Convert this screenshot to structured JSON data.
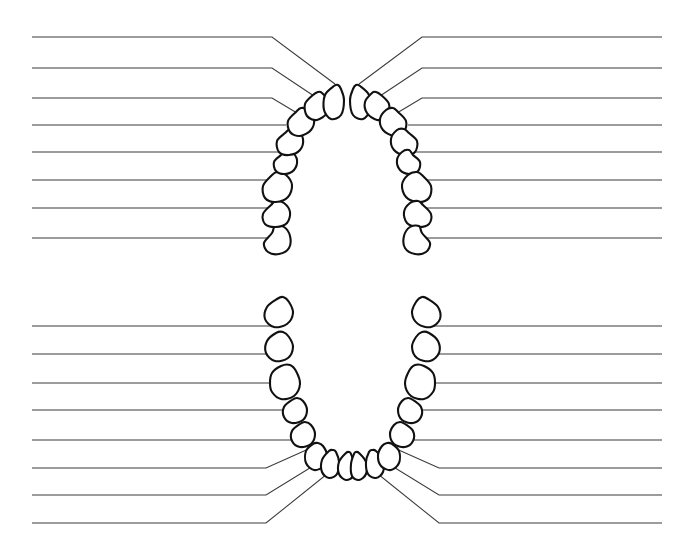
{
  "page": {
    "width": 694,
    "height": 558,
    "background_color": "#ffffff"
  },
  "style": {
    "tooth_outline_color": "#111111",
    "tooth_fill_color": "#ffffff",
    "leader_line_color": "#3a3a3a",
    "tooth_stroke_width": 2.1,
    "leader_stroke_width": 1.05
  },
  "diagram": {
    "type": "dental-arch-worksheet",
    "arches": [
      {
        "name": "upper-arch",
        "label": "Maxillary (upper) arch",
        "orientation": "opening-downward",
        "tooth_count": 16,
        "blank_label_line_count": 16
      },
      {
        "name": "lower-arch",
        "label": "Mandibular (lower) arch",
        "orientation": "opening-upward",
        "tooth_count": 16,
        "blank_label_line_count": 16
      }
    ],
    "total_teeth": 32,
    "total_label_lines": 32,
    "label_text": ""
  },
  "upper_arch": {
    "teeth": [
      {
        "id": "U-L-8",
        "side": "left",
        "points": "272,233 264,243 268,252 279,254 289,248 290,236 284,227 275,226"
      },
      {
        "id": "U-L-7",
        "side": "left",
        "points": "271,205 263,214 265,224 276,227 287,223 290,212 284,203 276,201"
      },
      {
        "id": "U-L-6",
        "side": "left",
        "points": "271,176 263,186 265,198 276,202 288,197 292,185 286,175 277,172"
      },
      {
        "id": "U-L-5",
        "side": "left",
        "points": "281,155 274,162 276,171 285,174 294,170 297,160 292,152 285,150"
      },
      {
        "id": "U-L-4",
        "side": "left",
        "points": "285,133 277,141 279,152 289,155 300,150 303,139 297,130 290,129"
      },
      {
        "id": "U-L-3",
        "side": "left",
        "points": "296,112 288,121 290,132 300,136 311,130 314,119 308,110 301,108"
      },
      {
        "id": "U-L-2",
        "side": "left",
        "points": "313,95 305,104 307,116 317,120 327,113 329,102 322,93 318,92"
      },
      {
        "id": "U-L-1",
        "side": "left",
        "points": "334,86 325,95 324,110 331,119 341,115 344,100 341,89 338,85"
      },
      {
        "id": "U-R-1",
        "side": "right",
        "points": "360,86 369,95 370,110 363,119 353,115 350,100 353,89 356,85"
      },
      {
        "id": "U-R-2",
        "side": "right",
        "points": "381,95 389,104 387,116 377,120 367,113 365,102 372,93 376,92"
      },
      {
        "id": "U-R-3",
        "side": "right",
        "points": "398,112 406,121 404,132 394,136 383,130 380,119 386,110 393,108"
      },
      {
        "id": "U-R-4",
        "side": "right",
        "points": "409,133 417,141 415,152 405,155 394,150 391,139 397,130 404,129"
      },
      {
        "id": "U-R-5",
        "side": "right",
        "points": "413,155 420,162 418,171 409,174 400,170 397,160 402,152 409,150"
      },
      {
        "id": "U-R-6",
        "side": "right",
        "points": "423,176 431,186 429,198 418,202 406,197 402,185 408,175 417,172"
      },
      {
        "id": "U-R-7",
        "side": "right",
        "points": "423,205 431,214 429,224 418,227 407,223 404,212 410,203 418,201"
      },
      {
        "id": "U-R-8",
        "side": "right",
        "points": "422,233 430,243 426,252 415,254 405,248 404,236 410,227 419,226"
      }
    ],
    "leader_lines_left": [
      {
        "id": "UL-line-1",
        "shape": "bent",
        "d": "M 32,37 L 272,37 L 335,84"
      },
      {
        "id": "UL-line-2",
        "shape": "bent",
        "d": "M 32,68 L 272,68 L 314,96"
      },
      {
        "id": "UL-line-3",
        "shape": "bent",
        "d": "M 32,98 L 272,98 L 297,113"
      },
      {
        "id": "UL-line-4",
        "shape": "straight",
        "d": "M 32,125 L 286,125"
      },
      {
        "id": "UL-line-5",
        "shape": "straight",
        "d": "M 32,152 L 281,152"
      },
      {
        "id": "UL-line-6",
        "shape": "straight",
        "d": "M 32,180 L 272,180"
      },
      {
        "id": "UL-line-7",
        "shape": "straight",
        "d": "M 32,208 L 271,208"
      },
      {
        "id": "UL-line-8",
        "shape": "straight",
        "d": "M 32,238 L 271,238"
      }
    ],
    "leader_lines_right": [
      {
        "id": "UR-line-1",
        "shape": "bent",
        "d": "M 662,37 L 422,37 L 359,84"
      },
      {
        "id": "UR-line-2",
        "shape": "bent",
        "d": "M 662,68 L 422,68 L 380,96"
      },
      {
        "id": "UR-line-3",
        "shape": "bent",
        "d": "M 662,98 L 422,98 L 397,113"
      },
      {
        "id": "UR-line-4",
        "shape": "straight",
        "d": "M 662,125 L 408,125"
      },
      {
        "id": "UR-line-5",
        "shape": "straight",
        "d": "M 662,152 L 413,152"
      },
      {
        "id": "UR-line-6",
        "shape": "straight",
        "d": "M 662,180 L 422,180"
      },
      {
        "id": "UR-line-7",
        "shape": "straight",
        "d": "M 662,208 L 423,208"
      },
      {
        "id": "UR-line-8",
        "shape": "straight",
        "d": "M 662,238 L 423,238"
      }
    ]
  },
  "lower_arch": {
    "teeth": [
      {
        "id": "L-L-8",
        "side": "left",
        "points": "277,299 267,307 265,319 274,327 287,324 293,313 289,302 283,297"
      },
      {
        "id": "L-L-7",
        "side": "left",
        "points": "276,333 267,341 266,353 275,361 288,358 293,347 289,337 283,332"
      },
      {
        "id": "L-L-6",
        "side": "left",
        "points": "281,366 272,373 270,383 272,392 281,399 294,396 300,384 296,371 290,365"
      },
      {
        "id": "L-L-5",
        "side": "left",
        "points": "292,400 284,407 284,417 292,423 303,420 307,410 303,401 297,398"
      },
      {
        "id": "L-L-4",
        "side": "left",
        "points": "300,424 292,431 292,441 300,447 311,444 315,434 311,425 305,422"
      },
      {
        "id": "L-L-3",
        "side": "left",
        "points": "313,444 306,451 306,463 314,470 324,466 327,455 323,446 318,443"
      },
      {
        "id": "L-L-2",
        "side": "left",
        "points": "329,451 322,460 322,472 329,478 337,474 339,462 336,452 333,450"
      },
      {
        "id": "L-L-1",
        "side": "left",
        "points": "346,453 339,462 339,474 346,480 353,476 354,464 351,454 349,452"
      },
      {
        "id": "L-R-1",
        "side": "right",
        "points": "359,453 366,462 366,474 359,480 352,476 351,464 354,454 356,452"
      },
      {
        "id": "L-R-2",
        "side": "right",
        "points": "376,451 383,460 383,472 376,478 368,474 366,462 369,452 372,450"
      },
      {
        "id": "L-R-3",
        "side": "right",
        "points": "392,444 399,451 399,463 391,470 381,466 378,455 382,446 387,443"
      },
      {
        "id": "L-R-4",
        "side": "right",
        "points": "405,424 413,431 413,441 405,447 394,444 390,434 394,425 400,422"
      },
      {
        "id": "L-R-5",
        "side": "right",
        "points": "413,400 421,407 421,417 413,423 402,420 398,410 402,401 408,398"
      },
      {
        "id": "L-R-6",
        "side": "right",
        "points": "424,366 433,373 435,383 433,392 424,399 411,396 405,384 409,371 415,365"
      },
      {
        "id": "L-R-7",
        "side": "right",
        "points": "429,333 438,341 439,353 430,361 417,358 412,347 416,337 422,332"
      },
      {
        "id": "L-R-8",
        "side": "right",
        "points": "428,299 438,307 440,319 431,327 418,324 412,313 416,302 422,297"
      }
    ],
    "leader_lines_left": [
      {
        "id": "LL-line-1",
        "shape": "straight",
        "d": "M 32,326 L 271,326"
      },
      {
        "id": "LL-line-2",
        "shape": "straight",
        "d": "M 32,354 L 272,354"
      },
      {
        "id": "LL-line-3",
        "shape": "straight",
        "d": "M 32,383 L 273,383"
      },
      {
        "id": "LL-line-4",
        "shape": "straight",
        "d": "M 32,410 L 286,410"
      },
      {
        "id": "LL-line-5",
        "shape": "straight",
        "d": "M 32,440 L 294,440"
      },
      {
        "id": "LL-line-6",
        "shape": "bent",
        "d": "M 32,468 L 266,468 L 313,447"
      },
      {
        "id": "LL-line-7",
        "shape": "bent",
        "d": "M 32,495 L 266,495 L 331,455"
      },
      {
        "id": "LL-line-8",
        "shape": "bent",
        "d": "M 32,523 L 266,523 L 347,458"
      }
    ],
    "leader_lines_right": [
      {
        "id": "LR-line-1",
        "shape": "straight",
        "d": "M 662,326 L 434,326"
      },
      {
        "id": "LR-line-2",
        "shape": "straight",
        "d": "M 662,354 L 433,354"
      },
      {
        "id": "LR-line-3",
        "shape": "straight",
        "d": "M 662,383 L 432,383"
      },
      {
        "id": "LR-line-4",
        "shape": "straight",
        "d": "M 662,410 L 419,410"
      },
      {
        "id": "LR-line-5",
        "shape": "straight",
        "d": "M 662,440 L 411,440"
      },
      {
        "id": "LR-line-6",
        "shape": "bent",
        "d": "M 662,468 L 439,468 L 392,447"
      },
      {
        "id": "LR-line-7",
        "shape": "bent",
        "d": "M 662,495 L 439,495 L 374,455"
      },
      {
        "id": "LR-line-8",
        "shape": "bent",
        "d": "M 662,523 L 439,523 L 358,458"
      }
    ]
  }
}
